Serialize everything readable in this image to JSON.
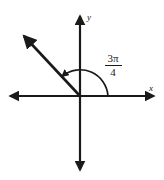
{
  "figure": {
    "type": "angle-diagram",
    "background_color": "#ffffff",
    "stroke_color": "#1a1a1a",
    "axes": {
      "x_label": "x",
      "y_label": "y",
      "origin": {
        "x": 80,
        "y": 96
      },
      "x_axis": {
        "left_end": 8,
        "right_end": 156
      },
      "y_axis": {
        "top_end": 14,
        "bottom_end": 172
      }
    },
    "ray": {
      "angle_degrees": 135,
      "start": {
        "x": 80,
        "y": 96
      },
      "end": {
        "x": 22,
        "y": 34
      },
      "has_arrowhead": true
    },
    "arc": {
      "radius": 28,
      "start_angle_degrees": 0,
      "end_angle_degrees": 135,
      "direction": "counterclockwise",
      "has_arrowhead": true
    },
    "angle_label": {
      "numerator": "3π",
      "denominator": "4",
      "full_text": "3π/4"
    }
  }
}
